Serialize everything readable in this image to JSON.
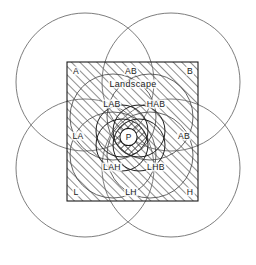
{
  "figure": {
    "canvas": {
      "width": 256,
      "height": 265,
      "background": "#ffffff"
    },
    "stroke_color": "#555555",
    "square_stroke_color": "#1b1b1b",
    "hatch_color": "#333333",
    "text_color": "#1b1b1b",
    "square": {
      "x": 67,
      "y": 62,
      "width": 131,
      "height": 139
    },
    "outer_circles": [
      {
        "name": "outer-circle-top-left",
        "cx": 85,
        "cy": 82,
        "r": 69
      },
      {
        "name": "outer-circle-top-right",
        "cx": 171,
        "cy": 82,
        "r": 69
      },
      {
        "name": "outer-circle-bottom-left",
        "cx": 85,
        "cy": 168,
        "r": 69
      },
      {
        "name": "outer-circle-bottom-right",
        "cx": 171,
        "cy": 168,
        "r": 69
      }
    ],
    "mid_circles": [
      {
        "name": "mid-circle-top-left",
        "cx": 113,
        "cy": 117,
        "r": 43
      },
      {
        "name": "mid-circle-top-right",
        "cx": 150,
        "cy": 117,
        "r": 43
      },
      {
        "name": "mid-circle-bottom-left",
        "cx": 113,
        "cy": 155,
        "r": 43
      },
      {
        "name": "mid-circle-bottom-right",
        "cx": 150,
        "cy": 155,
        "r": 43
      }
    ],
    "core_circles": [
      {
        "name": "core-circle-top-left",
        "cx": 122,
        "cy": 131,
        "r": 26
      },
      {
        "name": "core-circle-top-right",
        "cx": 139,
        "cy": 131,
        "r": 26
      },
      {
        "name": "core-circle-bottom-left",
        "cx": 122,
        "cy": 145,
        "r": 26
      },
      {
        "name": "core-circle-bottom-right",
        "cx": 139,
        "cy": 145,
        "r": 26
      }
    ],
    "center_marker": {
      "name": "p-core-circle",
      "cx": 128.5,
      "cy": 137,
      "r": 8.6,
      "fill": "#ffffff"
    }
  },
  "labels": {
    "corner_top_left": {
      "text": "A",
      "x": 76,
      "y": 71
    },
    "corner_top_right": {
      "text": "B",
      "x": 190,
      "y": 71
    },
    "corner_bottom_left": {
      "text": "L",
      "x": 76,
      "y": 192
    },
    "corner_bottom_right": {
      "text": "H",
      "x": 190,
      "y": 192
    },
    "edge_top": {
      "text": "AB",
      "x": 131,
      "y": 71
    },
    "edge_bottom": {
      "text": "LH",
      "x": 131,
      "y": 192
    },
    "edge_right": {
      "text": "AB",
      "x": 184,
      "y": 136
    },
    "edge_left": {
      "text": "LA",
      "x": 78,
      "y": 136
    },
    "subtitle": {
      "text": "Landscape",
      "x": 133,
      "y": 84
    },
    "inner_top_left": {
      "text": "LAB",
      "x": 112,
      "y": 104
    },
    "inner_top_right": {
      "text": "HAB",
      "x": 156,
      "y": 104
    },
    "inner_bottom_left": {
      "text": "LAH",
      "x": 112,
      "y": 167
    },
    "inner_bottom_right": {
      "text": "LHB",
      "x": 156,
      "y": 167
    },
    "center": {
      "text": "P",
      "x": 128.5,
      "y": 137
    }
  }
}
